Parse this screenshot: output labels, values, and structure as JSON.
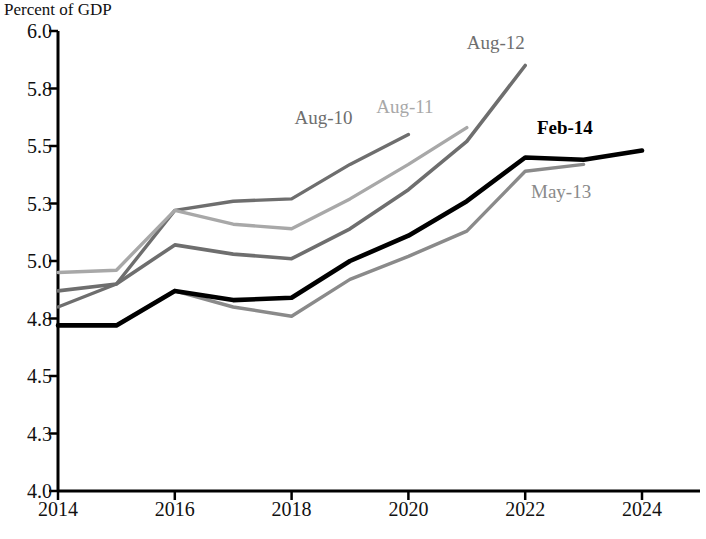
{
  "chart_data": {
    "type": "line",
    "title": "",
    "subtitle": "",
    "ylabel": "Percent of GDP",
    "xlabel": "",
    "ylim": [
      4.0,
      6.0
    ],
    "xlim": [
      2014,
      2024.6
    ],
    "grid": false,
    "legend_position": "inline-end-labels",
    "ytick_labels": [
      "6.0",
      "5.8",
      "5.5",
      "5.3",
      "5.0",
      "4.8",
      "4.5",
      "4.3",
      "4.0"
    ],
    "ytick_values": [
      6.0,
      5.75,
      5.5,
      5.25,
      5.0,
      4.75,
      4.5,
      4.25,
      4.0
    ],
    "xtick_labels": [
      "2014",
      "2016",
      "2018",
      "2020",
      "2022",
      "2024"
    ],
    "xtick_values": [
      2014,
      2016,
      2018,
      2020,
      2022,
      2024
    ],
    "series": [
      {
        "name": "Aug-10",
        "color": "#6e6e6e",
        "width": 3.4,
        "x": [
          2014,
          2015,
          2016,
          2017,
          2018,
          2019,
          2020
        ],
        "values": [
          4.8,
          4.9,
          5.22,
          5.26,
          5.27,
          5.42,
          5.55
        ],
        "label_x": 2018.05,
        "label_y": 5.62
      },
      {
        "name": "Aug-11",
        "color": "#a8a8a8",
        "width": 3.4,
        "x": [
          2014,
          2015,
          2016,
          2017,
          2018,
          2019,
          2020,
          2021
        ],
        "values": [
          4.95,
          4.96,
          5.22,
          5.16,
          5.14,
          5.27,
          5.42,
          5.58
        ],
        "label_x": 2019.45,
        "label_y": 5.67
      },
      {
        "name": "Aug-12",
        "color": "#6e6e6e",
        "width": 3.6,
        "x": [
          2014,
          2015,
          2016,
          2017,
          2018,
          2019,
          2020,
          2021,
          2022
        ],
        "values": [
          4.87,
          4.9,
          5.07,
          5.03,
          5.01,
          5.14,
          5.31,
          5.52,
          5.85
        ],
        "label_x": 2021.0,
        "label_y": 5.95
      },
      {
        "name": "May-13",
        "color": "#8a8a8a",
        "width": 3.4,
        "x": [
          2014,
          2015,
          2016,
          2017,
          2018,
          2019,
          2020,
          2021,
          2022,
          2023
        ],
        "values": [
          4.72,
          4.72,
          4.87,
          4.8,
          4.76,
          4.92,
          5.02,
          5.13,
          5.39,
          5.42
        ],
        "label_x": 2022.1,
        "label_y": 5.3
      },
      {
        "name": "Feb-14",
        "color": "#000000",
        "width": 4.6,
        "x": [
          2014,
          2015,
          2016,
          2017,
          2018,
          2019,
          2020,
          2021,
          2022,
          2023,
          2024
        ],
        "values": [
          4.72,
          4.72,
          4.87,
          4.83,
          4.84,
          5.0,
          5.11,
          5.26,
          5.45,
          5.44,
          5.48
        ],
        "label_x": 2022.2,
        "label_y": 5.58
      }
    ]
  }
}
